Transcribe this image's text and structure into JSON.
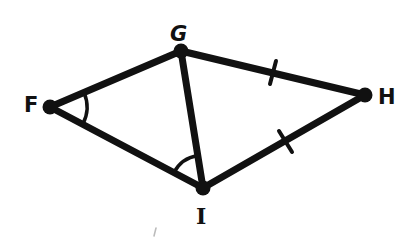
{
  "diagram": {
    "stroke_color": "#111111",
    "background": "#ffffff",
    "vertices": {
      "F": {
        "label": "F",
        "x": 50,
        "y": 107
      },
      "G": {
        "label": "G",
        "x": 181,
        "y": 51
      },
      "H": {
        "label": "H",
        "x": 365,
        "y": 95
      },
      "I": {
        "label": "I",
        "x": 203,
        "y": 188
      }
    },
    "segments": [
      {
        "from": "F",
        "to": "G"
      },
      {
        "from": "G",
        "to": "H"
      },
      {
        "from": "H",
        "to": "I"
      },
      {
        "from": "I",
        "to": "F"
      },
      {
        "from": "G",
        "to": "I"
      }
    ],
    "congruence_marks": [
      {
        "segment": "GH",
        "ticks": 1
      },
      {
        "segment": "HI",
        "ticks": 1
      }
    ],
    "angle_marks": [
      {
        "vertex": "F",
        "angle": "GFI",
        "arcs": 1
      },
      {
        "vertex": "I",
        "angle": "FIG",
        "arcs": 1
      }
    ]
  }
}
